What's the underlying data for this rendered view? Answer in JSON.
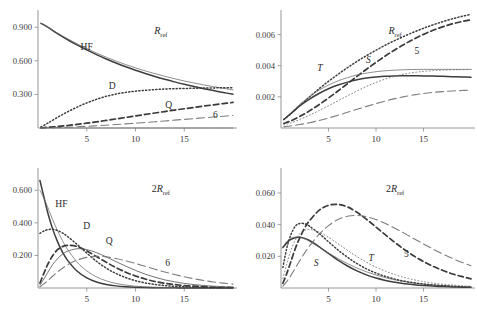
{
  "figure": {
    "name": "four-panel-line-plot-figure",
    "background": "#ffffff",
    "line_color": "#444444",
    "axis_color": "#8a8a8a"
  },
  "panels": [
    {
      "id": "top-left",
      "annotation": "R",
      "annotation_sub": "ref",
      "annotation_prefix": "",
      "ylabels": [
        "0.900",
        "0.600",
        "0.300"
      ],
      "yvalues": [
        0.9,
        0.6,
        0.3
      ],
      "xlabels": [
        "5",
        "10",
        "15"
      ],
      "xvalues": [
        5,
        10,
        15
      ],
      "curve_labels": [
        {
          "text": "HF",
          "x": 5.0,
          "y": 0.7
        },
        {
          "text": "D",
          "x": 7.6,
          "y": 0.345
        },
        {
          "text": "Q",
          "x": 13.4,
          "y": 0.175
        },
        {
          "text": "6",
          "x": 18.2,
          "y": 0.085
        }
      ]
    },
    {
      "id": "top-right",
      "annotation": "R",
      "annotation_sub": "ref",
      "annotation_prefix": "",
      "ylabels": [
        "0.006",
        "0.004",
        "0.002"
      ],
      "yvalues": [
        0.006,
        0.004,
        0.002
      ],
      "xlabels": [
        "5",
        "10",
        "15"
      ],
      "xvalues": [
        5,
        10,
        15
      ],
      "curve_labels": [
        {
          "text": "T",
          "x": 4.1,
          "y": 0.00365
        },
        {
          "text": "S",
          "x": 9.2,
          "y": 0.00415
        },
        {
          "text": "5",
          "x": 14.3,
          "y": 0.00475
        }
      ]
    },
    {
      "id": "bottom-left",
      "annotation": "R",
      "annotation_sub": "ref",
      "annotation_prefix": "2",
      "ylabels": [
        "0.600",
        "0.400",
        "0.200"
      ],
      "yvalues": [
        0.6,
        0.4,
        0.2
      ],
      "xlabels": [
        "5",
        "10",
        "15"
      ],
      "xvalues": [
        5,
        10,
        15
      ],
      "curve_labels": [
        {
          "text": "HF",
          "x": 2.4,
          "y": 0.497
        },
        {
          "text": "D",
          "x": 5.0,
          "y": 0.363
        },
        {
          "text": "Q",
          "x": 7.3,
          "y": 0.268
        },
        {
          "text": "6",
          "x": 13.3,
          "y": 0.135
        }
      ]
    },
    {
      "id": "bottom-right",
      "annotation": "R",
      "annotation_sub": "ref",
      "annotation_prefix": "2",
      "ylabels": [
        "0.060",
        "0.040",
        "0.020"
      ],
      "yvalues": [
        0.06,
        0.04,
        0.02
      ],
      "xlabels": [
        "5",
        "10",
        "15"
      ],
      "xvalues": [
        5,
        10,
        15
      ],
      "curve_labels": [
        {
          "text": "S",
          "x": 3.7,
          "y": 0.0138
        },
        {
          "text": "T",
          "x": 9.5,
          "y": 0.0168
        },
        {
          "text": "5",
          "x": 13.2,
          "y": 0.0196
        }
      ]
    }
  ],
  "chart_data": [
    {
      "type": "line",
      "panel": "top-left",
      "title": "R_ref",
      "xlabel": "",
      "ylabel": "",
      "xlim": [
        0,
        20
      ],
      "ylim": [
        0,
        1.0
      ],
      "grid": false,
      "legend_position": "inline-labels",
      "xticks": [
        5,
        10,
        15
      ],
      "yticks": [
        0.3,
        0.6,
        0.9
      ],
      "x": [
        0.3,
        1,
        2,
        3,
        4,
        5,
        6,
        7,
        8,
        9,
        10,
        11,
        12,
        13,
        14,
        15,
        16,
        17,
        18,
        19,
        20
      ],
      "series": [
        {
          "name": "HF",
          "style": "solid",
          "values": [
            0.935,
            0.9,
            0.843,
            0.79,
            0.742,
            0.697,
            0.655,
            0.616,
            0.58,
            0.547,
            0.516,
            0.487,
            0.46,
            0.435,
            0.412,
            0.39,
            0.37,
            0.351,
            0.334,
            0.317,
            0.302
          ]
        },
        {
          "name": "HF-2",
          "style": "solid-thin",
          "values": [
            0.935,
            0.902,
            0.848,
            0.798,
            0.752,
            0.709,
            0.669,
            0.632,
            0.598,
            0.566,
            0.537,
            0.51,
            0.485,
            0.462,
            0.44,
            0.42,
            0.402,
            0.385,
            0.369,
            0.354,
            0.341
          ]
        },
        {
          "name": "D",
          "style": "dotted",
          "values": [
            0.01,
            0.043,
            0.095,
            0.143,
            0.186,
            0.224,
            0.256,
            0.283,
            0.303,
            0.318,
            0.329,
            0.337,
            0.343,
            0.348,
            0.351,
            0.353,
            0.355,
            0.357,
            0.358,
            0.359,
            0.36
          ]
        },
        {
          "name": "Q",
          "style": "dashed",
          "values": [
            0.002,
            0.006,
            0.013,
            0.022,
            0.032,
            0.043,
            0.055,
            0.068,
            0.081,
            0.094,
            0.108,
            0.121,
            0.134,
            0.147,
            0.16,
            0.172,
            0.184,
            0.196,
            0.207,
            0.218,
            0.228
          ]
        },
        {
          "name": "6",
          "style": "long-dashed",
          "values": [
            0.001,
            0.002,
            0.004,
            0.007,
            0.011,
            0.015,
            0.02,
            0.025,
            0.031,
            0.037,
            0.043,
            0.049,
            0.056,
            0.063,
            0.07,
            0.077,
            0.084,
            0.091,
            0.098,
            0.105,
            0.112
          ]
        },
        {
          "name": "baseline",
          "style": "solid-thin",
          "values": [
            0.0,
            0.0,
            0.0,
            0.0,
            0.0,
            0.0,
            0.0,
            0.0,
            0.0,
            0.0,
            0.0,
            0.0,
            0.0,
            0.0,
            0.0,
            0.0,
            0.0,
            0.0,
            0.0,
            0.0,
            0.0
          ]
        }
      ]
    },
    {
      "type": "line",
      "panel": "top-right",
      "title": "R_ref",
      "xlabel": "",
      "ylabel": "",
      "xlim": [
        0,
        20
      ],
      "ylim": [
        0,
        0.0072
      ],
      "grid": false,
      "legend_position": "inline-labels",
      "xticks": [
        5,
        10,
        15
      ],
      "yticks": [
        0.002,
        0.004,
        0.006
      ],
      "x": [
        0.3,
        1,
        2,
        3,
        4,
        5,
        6,
        7,
        8,
        9,
        10,
        11,
        12,
        13,
        14,
        15,
        16,
        17,
        18,
        19,
        20
      ],
      "series": [
        {
          "name": "dotted-upper",
          "style": "dotted",
          "values": [
            0.00055,
            0.0009,
            0.00145,
            0.002,
            0.00252,
            0.003,
            0.00345,
            0.00388,
            0.00428,
            0.00465,
            0.005,
            0.00533,
            0.00563,
            0.00591,
            0.00617,
            0.00641,
            0.00663,
            0.00683,
            0.00701,
            0.00717,
            0.00731
          ]
        },
        {
          "name": "S-dashed-5",
          "style": "dashed",
          "values": [
            0.0003,
            0.00045,
            0.00075,
            0.0011,
            0.0015,
            0.00193,
            0.00238,
            0.00285,
            0.00332,
            0.00378,
            0.00422,
            0.00464,
            0.00503,
            0.00539,
            0.00572,
            0.00602,
            0.00628,
            0.0065,
            0.00669,
            0.00684,
            0.00696
          ]
        },
        {
          "name": "S-solid-thin",
          "style": "solid-thin",
          "values": [
            0.00055,
            0.00095,
            0.00153,
            0.00202,
            0.00243,
            0.00276,
            0.00303,
            0.00324,
            0.00341,
            0.00353,
            0.00362,
            0.00368,
            0.00372,
            0.00375,
            0.00376,
            0.00377,
            0.00377,
            0.00377,
            0.00377,
            0.00377,
            0.00377
          ]
        },
        {
          "name": "T-solid",
          "style": "solid",
          "values": [
            0.00055,
            0.0009,
            0.00143,
            0.00186,
            0.00222,
            0.00252,
            0.00276,
            0.00295,
            0.0031,
            0.00321,
            0.00328,
            0.00333,
            0.00335,
            0.00336,
            0.00336,
            0.00335,
            0.00334,
            0.00332,
            0.0033,
            0.00328,
            0.00326
          ]
        },
        {
          "name": "dotted-lower",
          "style": "dotted-fine",
          "values": [
            0.0002,
            0.00032,
            0.00055,
            0.00082,
            0.00112,
            0.00143,
            0.00175,
            0.00207,
            0.00238,
            0.00267,
            0.00293,
            0.00315,
            0.00333,
            0.00347,
            0.00357,
            0.00364,
            0.00369,
            0.00372,
            0.00374,
            0.00375,
            0.00376
          ]
        },
        {
          "name": "long-dashed-lower",
          "style": "long-dashed",
          "values": [
            8e-05,
            0.00013,
            0.00022,
            0.00034,
            0.00048,
            0.00064,
            0.00082,
            0.00101,
            0.0012,
            0.00139,
            0.00157,
            0.00174,
            0.00189,
            0.00202,
            0.00213,
            0.00222,
            0.00229,
            0.00234,
            0.00238,
            0.00241,
            0.00243
          ]
        }
      ]
    },
    {
      "type": "line",
      "panel": "bottom-left",
      "title": "2R_ref",
      "xlabel": "",
      "ylabel": "",
      "xlim": [
        0,
        20
      ],
      "ylim": [
        0,
        0.7
      ],
      "grid": false,
      "legend_position": "inline-labels",
      "xticks": [
        5,
        10,
        15
      ],
      "yticks": [
        0.2,
        0.4,
        0.6
      ],
      "x": [
        0.2,
        0.6,
        1,
        1.5,
        2,
        2.5,
        3,
        4,
        5,
        6,
        7,
        8,
        9,
        10,
        11,
        12,
        13,
        14,
        15,
        16,
        17,
        18,
        19,
        20
      ],
      "series": [
        {
          "name": "HF-solid",
          "style": "solid",
          "values": [
            0.66,
            0.56,
            0.462,
            0.363,
            0.285,
            0.222,
            0.173,
            0.104,
            0.062,
            0.037,
            0.022,
            0.013,
            0.008,
            0.005,
            0.003,
            0.002,
            0.001,
            0.001,
            0.0,
            0.0,
            0.0,
            0.0,
            0.0,
            0.0
          ]
        },
        {
          "name": "HF-thin",
          "style": "solid-thin",
          "values": [
            0.6,
            0.552,
            0.495,
            0.42,
            0.352,
            0.292,
            0.24,
            0.16,
            0.105,
            0.068,
            0.044,
            0.028,
            0.018,
            0.011,
            0.007,
            0.005,
            0.003,
            0.002,
            0.001,
            0.001,
            0.0,
            0.0,
            0.0,
            0.0
          ]
        },
        {
          "name": "D-dotted",
          "style": "dotted",
          "values": [
            0.335,
            0.35,
            0.358,
            0.36,
            0.353,
            0.338,
            0.318,
            0.268,
            0.214,
            0.164,
            0.122,
            0.089,
            0.064,
            0.045,
            0.031,
            0.022,
            0.015,
            0.01,
            0.007,
            0.005,
            0.003,
            0.002,
            0.001,
            0.001
          ]
        },
        {
          "name": "Q-dashed",
          "style": "dashed",
          "values": [
            0.03,
            0.09,
            0.145,
            0.198,
            0.235,
            0.254,
            0.262,
            0.255,
            0.228,
            0.193,
            0.158,
            0.125,
            0.097,
            0.074,
            0.055,
            0.04,
            0.029,
            0.021,
            0.015,
            0.011,
            0.008,
            0.005,
            0.004,
            0.003
          ]
        },
        {
          "name": "mid-thin",
          "style": "solid-thin-2",
          "values": [
            0.018,
            0.055,
            0.095,
            0.143,
            0.18,
            0.207,
            0.225,
            0.241,
            0.236,
            0.217,
            0.191,
            0.162,
            0.134,
            0.108,
            0.085,
            0.066,
            0.05,
            0.038,
            0.028,
            0.021,
            0.015,
            0.011,
            0.008,
            0.006
          ]
        },
        {
          "name": "6-long-dashed",
          "style": "long-dashed",
          "values": [
            0.008,
            0.025,
            0.045,
            0.072,
            0.098,
            0.121,
            0.141,
            0.171,
            0.188,
            0.194,
            0.191,
            0.181,
            0.167,
            0.151,
            0.133,
            0.115,
            0.098,
            0.083,
            0.069,
            0.057,
            0.046,
            0.037,
            0.03,
            0.024
          ]
        }
      ]
    },
    {
      "type": "line",
      "panel": "bottom-right",
      "title": "2R_ref",
      "xlabel": "",
      "ylabel": "",
      "xlim": [
        0,
        20
      ],
      "ylim": [
        0,
        0.072
      ],
      "grid": false,
      "legend_position": "inline-labels",
      "xticks": [
        5,
        10,
        15
      ],
      "yticks": [
        0.02,
        0.04,
        0.06
      ],
      "x": [
        0.2,
        0.6,
        1,
        1.5,
        2,
        2.5,
        3,
        4,
        5,
        6,
        7,
        8,
        9,
        10,
        11,
        12,
        13,
        14,
        15,
        16,
        17,
        18,
        19,
        20
      ],
      "series": [
        {
          "name": "S-solid",
          "style": "solid",
          "values": [
            0.0255,
            0.0285,
            0.0305,
            0.0318,
            0.032,
            0.0313,
            0.03,
            0.0262,
            0.0218,
            0.0176,
            0.0139,
            0.0108,
            0.0083,
            0.0063,
            0.0048,
            0.0036,
            0.0027,
            0.0021,
            0.0016,
            0.0012,
            0.0009,
            0.0007,
            0.0005,
            0.0004
          ]
        },
        {
          "name": "S-thin",
          "style": "solid-thin",
          "values": [
            0.026,
            0.0292,
            0.0313,
            0.0322,
            0.032,
            0.031,
            0.0295,
            0.0258,
            0.0221,
            0.0186,
            0.0154,
            0.0126,
            0.0102,
            0.0082,
            0.0065,
            0.0051,
            0.004,
            0.0031,
            0.0024,
            0.0019,
            0.0015,
            0.0011,
            0.0009,
            0.0007
          ]
        },
        {
          "name": "T-dotted",
          "style": "dotted",
          "values": [
            0.013,
            0.025,
            0.033,
            0.039,
            0.0408,
            0.0405,
            0.039,
            0.0345,
            0.0292,
            0.024,
            0.0194,
            0.0154,
            0.0121,
            0.0094,
            0.0073,
            0.0056,
            0.0043,
            0.0033,
            0.0025,
            0.0019,
            0.0015,
            0.0011,
            0.0009,
            0.0007
          ]
        },
        {
          "name": "dotted-fine-2",
          "style": "dotted-fine",
          "values": [
            0.006,
            0.015,
            0.023,
            0.0302,
            0.0345,
            0.0365,
            0.037,
            0.0353,
            0.032,
            0.028,
            0.0238,
            0.0198,
            0.0163,
            0.0132,
            0.0106,
            0.0084,
            0.0066,
            0.0052,
            0.004,
            0.0031,
            0.0024,
            0.0019,
            0.0014,
            0.0011
          ]
        },
        {
          "name": "dashed-peak",
          "style": "dashed",
          "values": [
            0.003,
            0.009,
            0.016,
            0.0248,
            0.032,
            0.038,
            0.0425,
            0.049,
            0.0522,
            0.0528,
            0.0512,
            0.0478,
            0.0434,
            0.0385,
            0.0335,
            0.0287,
            0.0242,
            0.0202,
            0.0167,
            0.0137,
            0.0112,
            0.009,
            0.0073,
            0.0058
          ]
        },
        {
          "name": "5-long-dashed",
          "style": "long-dashed",
          "values": [
            0.0012,
            0.004,
            0.0075,
            0.0125,
            0.0175,
            0.0222,
            0.0265,
            0.0338,
            0.0394,
            0.0433,
            0.0453,
            0.0458,
            0.045,
            0.0432,
            0.0407,
            0.0377,
            0.0345,
            0.0311,
            0.0278,
            0.0246,
            0.0216,
            0.0188,
            0.0163,
            0.0141
          ]
        }
      ]
    }
  ]
}
